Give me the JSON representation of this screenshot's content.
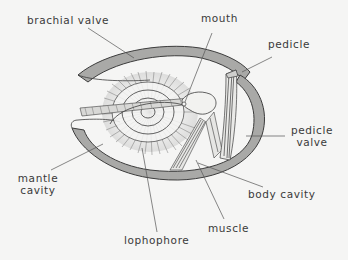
{
  "diagram": {
    "colors": {
      "background": "#f5f5f4",
      "shell_fill": "#a9a9a7",
      "outline": "#3c3c3c",
      "leader_line": "#555555",
      "label_text": "#3a3a3a"
    },
    "labels": {
      "brachial_valve": "brachial valve",
      "mouth": "mouth",
      "pedicle": "pedicle",
      "pedicle_valve_line1": "pedicle",
      "pedicle_valve_line2": "valve",
      "mantle_cavity_line1": "mantle",
      "mantle_cavity_line2": "cavity",
      "body_cavity": "body cavity",
      "muscle": "muscle",
      "lophophore": "lophophore"
    }
  }
}
